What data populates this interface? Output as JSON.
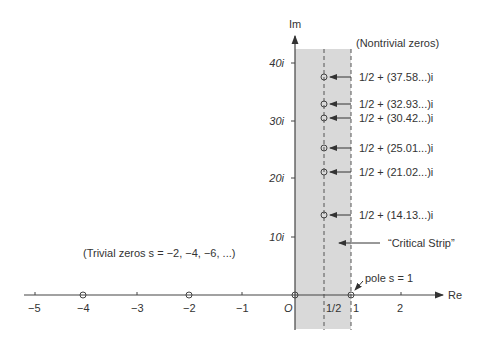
{
  "diagram": {
    "axes": {
      "re_label": "Re",
      "im_label": "Im",
      "origin_label": "O",
      "x_ticks": [
        {
          "value": -5,
          "label": "−5"
        },
        {
          "value": -4,
          "label": "−4"
        },
        {
          "value": -3,
          "label": "−3"
        },
        {
          "value": -2,
          "label": "−2"
        },
        {
          "value": -1,
          "label": "−1"
        },
        {
          "value": 1,
          "label": "1"
        },
        {
          "value": 2,
          "label": "2"
        }
      ],
      "half_label": "1/2",
      "y_ticks": [
        {
          "value": 10,
          "label": "10i"
        },
        {
          "value": 20,
          "label": "20i"
        },
        {
          "value": 30,
          "label": "30i"
        },
        {
          "value": 40,
          "label": "40i"
        }
      ]
    },
    "nontrivial_title": "(Nontrivial zeros)",
    "nontrivial_zeros": [
      {
        "im": 37.58,
        "label": "1/2 + (37.58...)i"
      },
      {
        "im": 32.93,
        "label": "1/2 + (32.93...)i"
      },
      {
        "im": 30.42,
        "label": "1/2 + (30.42...)i"
      },
      {
        "im": 25.01,
        "label": "1/2 + (25.01...)i"
      },
      {
        "im": 21.02,
        "label": "1/2 + (21.02...)i"
      },
      {
        "im": 14.13,
        "label": "1/2 + (14.13...)i"
      }
    ],
    "critical_strip_label": "“Critical Strip”",
    "trivial_zeros_label": "(Trivial zeros  s = −2, −4, −6, ...)",
    "trivial_zeros": [
      -2,
      -4
    ],
    "pole_label": "pole  s = 1",
    "colors": {
      "strip": "#d9d9d9",
      "axis": "#444444",
      "text": "#333333"
    }
  }
}
